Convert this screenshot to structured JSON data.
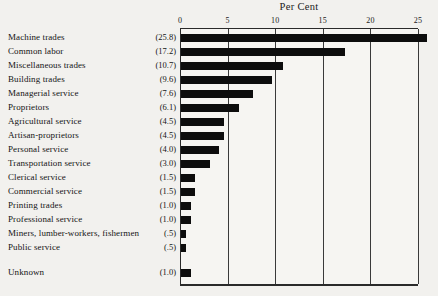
{
  "chart_data": {
    "type": "bar",
    "orientation": "horizontal",
    "title": "Per Cent",
    "xlabel": "Per Cent",
    "ylabel": "",
    "xlim": [
      0,
      25
    ],
    "grid": true,
    "legend": null,
    "xticks": [
      0,
      5,
      10,
      15,
      20,
      25
    ],
    "xtick_labels": [
      "0",
      "5",
      "10",
      "15",
      "20",
      "25"
    ],
    "axis_position": "top",
    "categories": [
      "Machine trades",
      "Common labor",
      "Miscellaneous trades",
      "Building trades",
      "Managerial service",
      "Proprietors",
      "Agricultural service",
      "Artisan-proprietors",
      "Personal service",
      "Transportation service",
      "Clerical service",
      "Commercial service",
      "Printing trades",
      "Professional service",
      "Miners, lumber-workers, fishermen",
      "Public service",
      "Unknown"
    ],
    "values": [
      25.8,
      17.2,
      10.7,
      9.6,
      7.6,
      6.1,
      4.5,
      4.5,
      4.0,
      3.0,
      1.5,
      1.5,
      1.0,
      1.0,
      0.5,
      0.5,
      1.0
    ],
    "value_labels": [
      "(25.8)",
      "(17.2)",
      "(10.7)",
      "(9.6)",
      "(7.6)",
      "(6.1)",
      "(4.5)",
      "(4.5)",
      "(4.0)",
      "(3.0)",
      "(1.5)",
      "(1.5)",
      "(1.0)",
      "(1.0)",
      "(.5)",
      "(.5)",
      "(1.0)"
    ],
    "separated_rows_after_index": 15,
    "bar_color": "#0d0d0d",
    "background_color": "#f2f1ee",
    "axis_color": "#2a2a2a"
  }
}
